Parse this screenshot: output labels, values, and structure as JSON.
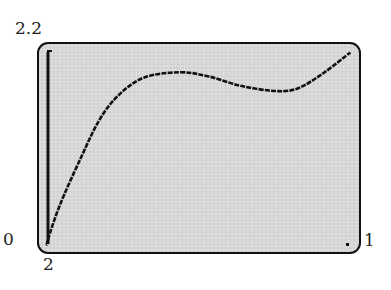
{
  "window_labels": {
    "ymax": "2.2",
    "ymin": "2",
    "xmin": "0",
    "xmax": "1"
  },
  "colors": {
    "screen_background": "#d9d9d9",
    "curve": "#111111",
    "frame": "#111111"
  },
  "chart_data": {
    "type": "line",
    "title": "",
    "xlabel": "",
    "ylabel": "",
    "xlim": [
      0,
      1
    ],
    "ylim": [
      2,
      2.2
    ],
    "grid": false,
    "axes": {
      "y_axis_at_x": 0
    },
    "series": [
      {
        "name": "f(x)",
        "x": [
          0.0,
          0.03,
          0.068,
          0.13,
          0.19,
          0.25,
          0.33,
          0.44,
          0.53,
          0.63,
          0.74,
          0.81,
          0.89,
          0.97
        ],
        "values": [
          2.0,
          2.011,
          2.045,
          2.088,
          2.126,
          2.15,
          2.167,
          2.172,
          2.168,
          2.159,
          2.154,
          2.157,
          2.172,
          2.191
        ]
      }
    ],
    "annotations": [
      "local maximum near x≈0.44",
      "local minimum near x≈0.74"
    ]
  }
}
